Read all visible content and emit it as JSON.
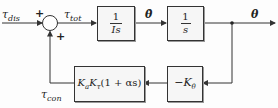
{
  "diagram": {
    "type": "block-diagram",
    "title": "",
    "signals": {
      "disturbance": {
        "sym": "τ",
        "sub": "dis"
      },
      "total": {
        "sym": "τ",
        "sub": "tot"
      },
      "theta_dot": "θ̇",
      "output": "θ",
      "control": {
        "sym": "τ",
        "sub": "con"
      }
    },
    "summing_junction": {
      "input_sign_left": "+",
      "input_sign_bottom": "+"
    },
    "blocks": [
      {
        "id": "plant-inertia",
        "numerator": "1",
        "denominator": "Is"
      },
      {
        "id": "integrator",
        "numerator": "1",
        "denominator": "s"
      },
      {
        "id": "gain",
        "label": "−K",
        "label_sub": "θ"
      },
      {
        "id": "controller",
        "label_a": "K",
        "sub_a": "a",
        "label_b": "K",
        "sub_b": "τ",
        "label_c": "(1 + αs)"
      }
    ],
    "colors": {
      "line": "#333333",
      "box_fill": "#f6f6f6",
      "background": "#fdfdfd"
    }
  }
}
